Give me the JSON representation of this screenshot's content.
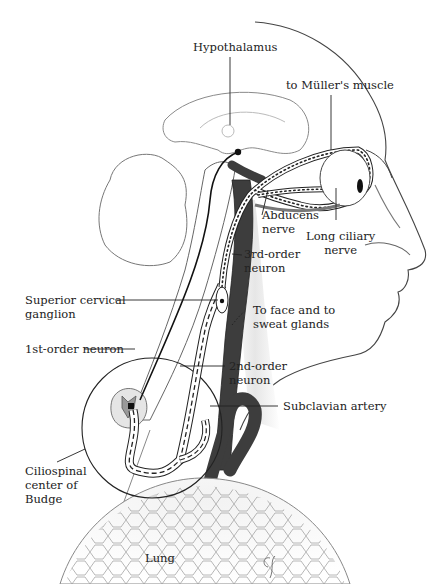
{
  "diagram": {
    "colors": {
      "line": "#222222",
      "nerve_fill": "#ffffff",
      "artery": "#3a3a3a",
      "outline_light": "#9a9a9a",
      "shade": "#d9d9d9"
    },
    "labels": {
      "hypothalamus": "Hypothalamus",
      "muller": "to Müller's muscle",
      "abducens_1": "Abducens",
      "abducens_2": "nerve",
      "long_ciliary_1": "Long ciliary",
      "long_ciliary_2": "nerve",
      "third_order_1": "3rd-order",
      "third_order_2": "neuron",
      "superior_cervical_1": "Superior cervical",
      "superior_cervical_2": "ganglion",
      "face_sweat_1": "To face and to",
      "face_sweat_2": "sweat glands",
      "first_order": "1st-order neuron",
      "second_order_1": "2nd-order",
      "second_order_2": "neuron",
      "subclavian": "Subclavian artery",
      "ciliospinal_1": "Ciliospinal",
      "ciliospinal_2": "center of",
      "ciliospinal_3": "Budge",
      "lung": "Lung"
    },
    "signature": "CG"
  }
}
